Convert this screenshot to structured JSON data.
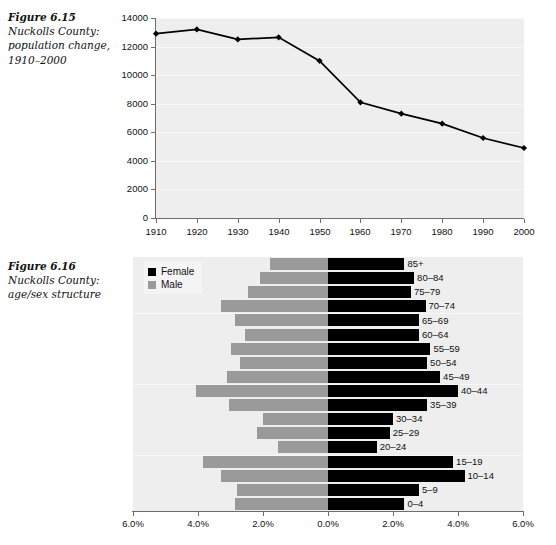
{
  "figure_615": {
    "number": "Figure 6.15",
    "description_line1": "Nuckolls County:",
    "description_line2": "population change,",
    "description_line3": "1910–2000"
  },
  "figure_616": {
    "number": "Figure 6.16",
    "description_line1": "Nuckolls County:",
    "description_line2": "age/sex structure"
  },
  "legend": {
    "female_label": "Female",
    "male_label": "Male",
    "female_color": "#000000",
    "male_color": "#9a9a9a"
  },
  "colors": {
    "plot_background": "#eeeeee",
    "axis": "#6d6d6d",
    "line": "#000000"
  },
  "chart_data": [
    {
      "type": "line",
      "title": "Nuckolls County: population change, 1910–2000",
      "xlabel": "",
      "ylabel": "",
      "x": [
        1910,
        1920,
        1930,
        1940,
        1950,
        1960,
        1970,
        1980,
        1990,
        2000
      ],
      "xticklabels": [
        "1910",
        "1920",
        "1930",
        "1940",
        "1950",
        "1960",
        "1970",
        "1980",
        "1990",
        "2000"
      ],
      "values": [
        12900,
        13200,
        12500,
        12650,
        11000,
        8100,
        7300,
        6600,
        5600,
        4900
      ],
      "yticks": [
        0,
        2000,
        4000,
        6000,
        8000,
        10000,
        12000,
        14000
      ],
      "yticklabels": [
        "0",
        "2000",
        "4000",
        "6000",
        "8000",
        "10000",
        "12000",
        "14000"
      ],
      "ylim": [
        0,
        14000
      ],
      "xlim": [
        1910,
        2000
      ],
      "grid": true,
      "legend": "none",
      "marker": "diamond"
    },
    {
      "type": "bar",
      "orientation": "horizontal-pyramid",
      "title": "Nuckolls County: age/sex structure",
      "xlabel": "",
      "ylabel": "",
      "categories": [
        "0–4",
        "5–9",
        "10–14",
        "15–19",
        "20–24",
        "25–29",
        "30–34",
        "35–39",
        "40–44",
        "45–49",
        "50–54",
        "55–59",
        "60–64",
        "65–69",
        "70–74",
        "75–79",
        "80–84",
        "85+"
      ],
      "series": [
        {
          "name": "Male",
          "values": [
            2.85,
            2.8,
            3.3,
            3.85,
            1.55,
            2.2,
            2.0,
            3.05,
            4.05,
            3.1,
            2.7,
            3.0,
            2.55,
            2.85,
            3.3,
            2.45,
            2.1,
            1.8
          ]
        },
        {
          "name": "Female",
          "values": [
            2.35,
            2.8,
            4.2,
            3.85,
            1.5,
            1.9,
            2.0,
            3.05,
            4.0,
            3.45,
            3.05,
            3.15,
            2.8,
            2.8,
            3.0,
            2.55,
            2.65,
            2.35
          ]
        }
      ],
      "xticks": [
        -6,
        -4,
        -2,
        0,
        2,
        4,
        6
      ],
      "xticklabels": [
        "6.0%",
        "4.0%",
        "2.0%",
        "0.0%",
        "2.0%",
        "4.0%",
        "6.0%"
      ],
      "xlim": [
        -6,
        6
      ],
      "grid": true,
      "legend": "top-left"
    }
  ]
}
